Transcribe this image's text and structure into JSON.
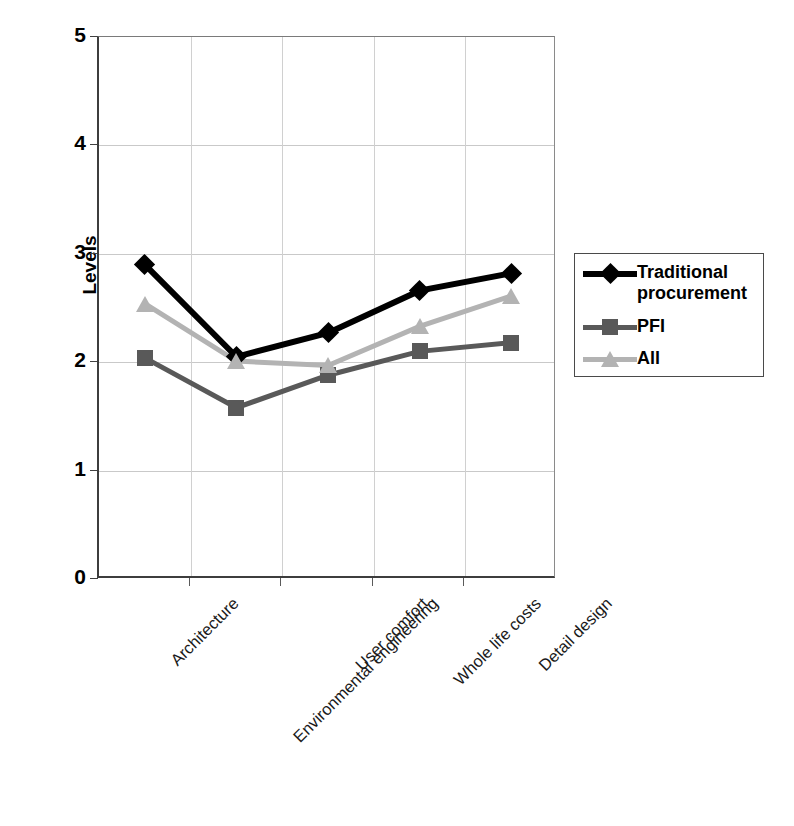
{
  "chart_data": {
    "type": "line",
    "title": "",
    "xlabel": "",
    "ylabel": "Levels",
    "categories": [
      "Architecture",
      "Environmental engineering",
      "User comfort",
      "Whole life costs",
      "Detail design"
    ],
    "series": [
      {
        "name": "Traditional procurement",
        "color": "#000000",
        "marker": "diamond",
        "values": [
          2.9,
          2.05,
          2.27,
          2.66,
          2.82
        ]
      },
      {
        "name": "PFI",
        "color": "#595959",
        "marker": "square",
        "values": [
          2.04,
          1.58,
          1.88,
          2.1,
          2.18
        ]
      },
      {
        "name": "All",
        "color": "#b3b3b3",
        "marker": "triangle",
        "values": [
          2.54,
          2.01,
          1.97,
          2.33,
          2.61
        ]
      }
    ],
    "ylim": [
      0,
      5
    ],
    "y_ticks": [
      "0",
      "1",
      "2",
      "3",
      "4",
      "5"
    ],
    "grid": "horizontal-and-vertical",
    "legend_position": "right"
  },
  "axis": {
    "y_title": "Levels",
    "y_tick_labels": [
      "5",
      "4",
      "3",
      "2",
      "1",
      "0"
    ]
  },
  "legend": {
    "entries": [
      {
        "label": "Traditional procurement"
      },
      {
        "label": "PFI"
      },
      {
        "label": "All"
      }
    ]
  }
}
